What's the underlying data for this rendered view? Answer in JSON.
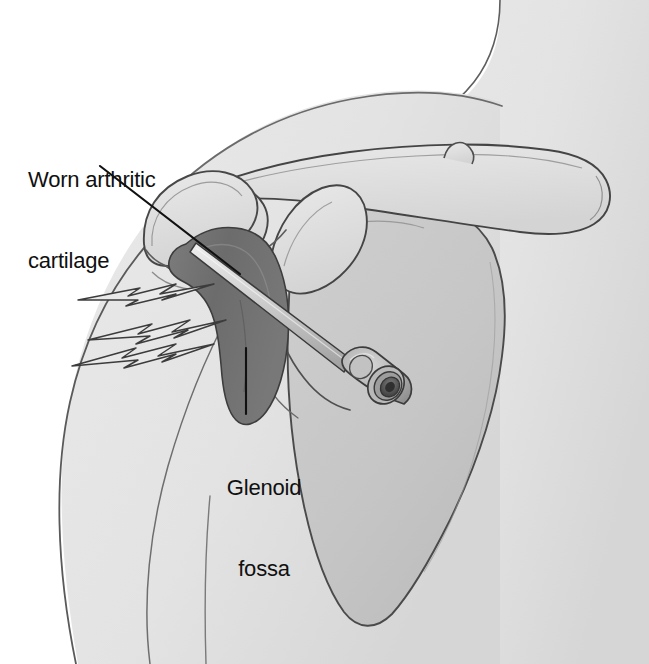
{
  "figure": {
    "type": "medical-illustration",
    "view": "anterior right shoulder",
    "width": 649,
    "height": 664
  },
  "labels": {
    "worn_cartilage": {
      "line1": "Worn arthritic",
      "line2": "cartilage",
      "full": "Worn arthritic cartilage"
    },
    "glenoid_fossa": {
      "line1": "Glenoid",
      "line2": "fossa",
      "full": "Glenoid fossa"
    }
  },
  "structures": [
    {
      "name": "clavicle",
      "label": "Clavicle"
    },
    {
      "name": "acromion",
      "label": "Acromion"
    },
    {
      "name": "coracoid-process",
      "label": "Coracoid process"
    },
    {
      "name": "humeral-head",
      "label": "Humeral head"
    },
    {
      "name": "humeral-shaft",
      "label": "Humerus shaft"
    },
    {
      "name": "scapula-body",
      "label": "Scapula"
    },
    {
      "name": "glenoid-fossa",
      "label": "Glenoid fossa"
    },
    {
      "name": "worn-cartilage",
      "label": "Worn arthritic cartilage"
    },
    {
      "name": "injection-needle",
      "label": "Injection needle"
    },
    {
      "name": "syringe-hub",
      "label": "Syringe luer hub"
    },
    {
      "name": "pain-indicator",
      "label": "Pain radiating from joint"
    },
    {
      "name": "torso-outline",
      "label": "Torso and neck outline"
    },
    {
      "name": "upper-arm-outline",
      "label": "Upper arm outline"
    }
  ],
  "colors": {
    "background": "#ffffff",
    "skin_fill": "#e6e6e6",
    "skin_shadow": "#dadada",
    "bone_fill": "#dcdcdc",
    "bone_light": "#e8e8e8",
    "scapula_fill": "#c9c9c9",
    "scapula_shadow": "#bfbfbf",
    "cartilage_dark": "#6f6f6f",
    "cartilage_mid": "#848484",
    "needle_fill": "#d2d2d2",
    "hub_fill": "#b4b4b4",
    "hub_dark": "#5a5a5a",
    "outline": "#3a3a3a",
    "leader_line": "#111111",
    "text": "#101010"
  },
  "leader_lines": [
    {
      "name": "leader-worn-cartilage",
      "from": "label",
      "to": "worn-cartilage"
    },
    {
      "name": "leader-glenoid-fossa",
      "from": "label",
      "to": "glenoid-fossa"
    }
  ]
}
